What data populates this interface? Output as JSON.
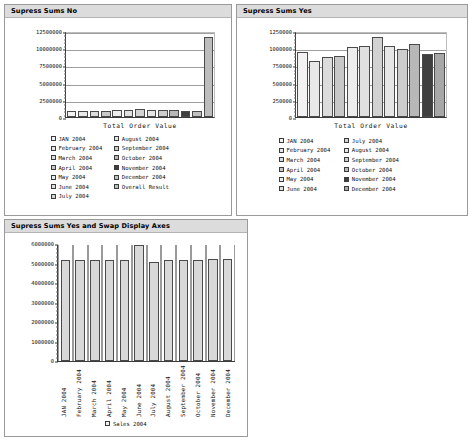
{
  "page": {
    "background": "#ffffff",
    "panel_border": "#9a9a9a",
    "title_bg": "#dcdcdc"
  },
  "panels": [
    {
      "id": "no",
      "title": "Supress Sums No"
    },
    {
      "id": "yes",
      "title": "Supress Sums Yes"
    },
    {
      "id": "swap",
      "title": "Supress Sums Yes and Swap Display Axes"
    }
  ],
  "chart_data": [
    {
      "id": "supress-sums-no",
      "type": "bar",
      "title": "Supress Sums No",
      "xlabel": "Total Order Value",
      "ylabel": "",
      "ylim": [
        0,
        12500000
      ],
      "yticks": [
        0,
        2500000,
        5000000,
        7500000,
        10000000,
        12500000
      ],
      "ytick_labels": [
        "0",
        "2500000",
        "5000000",
        "7500000",
        "10000000",
        "12500000"
      ],
      "grid": true,
      "legend_position": "bottom",
      "categories": [
        "JAN 2004",
        "February 2004",
        "March 2004",
        "April 2004",
        "May 2004",
        "June 2004",
        "July 2004",
        "August 2004",
        "September 2004",
        "October 2004",
        "November 2004",
        "December 2004",
        "Overall Result"
      ],
      "values": [
        965000,
        840000,
        895000,
        910000,
        1045000,
        1055000,
        1195000,
        1060000,
        1015000,
        1080000,
        940000,
        955000,
        11955000
      ],
      "colors": [
        "#f2f2f2",
        "#e8e8e8",
        "#dcdcdc",
        "#c8c8c8",
        "#ededed",
        "#e0e0e0",
        "#d2d2d2",
        "#e6e6e6",
        "#cdcdcd",
        "#b8b8b8",
        "#3f3f3f",
        "#c0c0c0",
        "#bdbdbd"
      ],
      "legend_entries": [
        {
          "label": "JAN 2004",
          "color": "#f2f2f2"
        },
        {
          "label": "February 2004",
          "color": "#e8e8e8"
        },
        {
          "label": "March 2004",
          "color": "#dcdcdc"
        },
        {
          "label": "April 2004",
          "color": "#c8c8c8"
        },
        {
          "label": "May 2004",
          "color": "#ededed"
        },
        {
          "label": "June 2004",
          "color": "#e0e0e0"
        },
        {
          "label": "July 2004",
          "color": "#d2d2d2"
        },
        {
          "label": "August 2004",
          "color": "#e6e6e6"
        },
        {
          "label": "September 2004",
          "color": "#cdcdcd"
        },
        {
          "label": "October 2004",
          "color": "#b8b8b8"
        },
        {
          "label": "November 2004",
          "color": "#3f3f3f"
        },
        {
          "label": "December 2004",
          "color": "#c0c0c0"
        },
        {
          "label": "Overall Result",
          "color": "#bdbdbd"
        }
      ]
    },
    {
      "id": "supress-sums-yes",
      "type": "bar",
      "title": "Supress Sums Yes",
      "xlabel": "Total Order Value",
      "ylabel": "",
      "ylim": [
        0,
        1250000
      ],
      "yticks": [
        0,
        250000,
        500000,
        750000,
        1000000,
        1250000
      ],
      "ytick_labels": [
        "0",
        "250000",
        "500000",
        "750000",
        "1000000",
        "1250000"
      ],
      "grid": true,
      "legend_position": "bottom",
      "categories": [
        "JAN 2004",
        "February 2004",
        "March 2004",
        "April 2004",
        "May 2004",
        "June 2004",
        "July 2004",
        "August 2004",
        "September 2004",
        "October 2004",
        "November 2004",
        "December 2004"
      ],
      "values": [
        965000,
        840000,
        895000,
        910000,
        1045000,
        1055000,
        1195000,
        1060000,
        1015000,
        1080000,
        940000,
        955000
      ],
      "colors": [
        "#f2f2f2",
        "#e8e8e8",
        "#dcdcdc",
        "#c8c8c8",
        "#ededed",
        "#e0e0e0",
        "#d2d2d2",
        "#e6e6e6",
        "#cdcdcd",
        "#b8b8b8",
        "#3f3f3f",
        "#a8a8a8"
      ],
      "legend_entries": [
        {
          "label": "JAN 2004",
          "color": "#f2f2f2"
        },
        {
          "label": "February 2004",
          "color": "#e8e8e8"
        },
        {
          "label": "March 2004",
          "color": "#dcdcdc"
        },
        {
          "label": "April 2004",
          "color": "#c8c8c8"
        },
        {
          "label": "May 2004",
          "color": "#ededed"
        },
        {
          "label": "June 2004",
          "color": "#e0e0e0"
        },
        {
          "label": "July 2004",
          "color": "#d2d2d2"
        },
        {
          "label": "August 2004",
          "color": "#e6e6e6"
        },
        {
          "label": "September 2004",
          "color": "#cdcdcd"
        },
        {
          "label": "October 2004",
          "color": "#b8b8b8"
        },
        {
          "label": "November 2004",
          "color": "#3f3f3f"
        },
        {
          "label": "December 2004",
          "color": "#a8a8a8"
        }
      ]
    },
    {
      "id": "supress-sums-yes-swap-axes",
      "type": "bar",
      "title": "Supress Sums Yes and Swap Display Axes",
      "xlabel": "",
      "ylabel": "",
      "ylim": [
        0,
        6000000
      ],
      "yticks": [
        0,
        1000000,
        2000000,
        3000000,
        4000000,
        5000000,
        6000000
      ],
      "ytick_labels": [
        "0",
        "1000000",
        "2000000",
        "3000000",
        "4000000",
        "5000000",
        "6000000"
      ],
      "grid": false,
      "legend_position": "bottom",
      "categories": [
        "JAN 2004",
        "February 2004",
        "March 2004",
        "April 2004",
        "May 2004",
        "June 2004",
        "July 2004",
        "August 2004",
        "September 2004",
        "October 2004",
        "November 2004",
        "December 2004"
      ],
      "series": [
        {
          "name": "Sales 2004",
          "color": "#d8d8d8",
          "values": [
            5200000,
            5230000,
            5200000,
            5200000,
            5230000,
            6000000,
            5130000,
            5230000,
            5250000,
            5230000,
            5260000,
            5260000
          ]
        }
      ],
      "legend_entries": [
        {
          "label": "Sales  2004",
          "color": "#f4f4f4"
        }
      ]
    }
  ]
}
